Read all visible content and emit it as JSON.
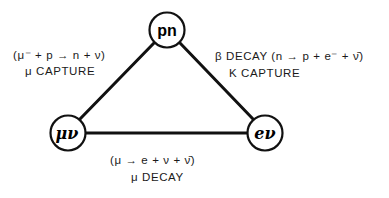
{
  "diagram": {
    "type": "triangle-interaction-diagram",
    "nodes": [
      {
        "id": "pn",
        "label": "pn",
        "cx": 167,
        "cy": 30,
        "r": 18
      },
      {
        "id": "mu-nu",
        "label": "μν",
        "cx": 68,
        "cy": 133,
        "r": 18
      },
      {
        "id": "e-nu",
        "label": "eν",
        "cx": 265,
        "cy": 133,
        "r": 18
      }
    ],
    "edges": [
      {
        "from": "mu-nu",
        "to": "pn",
        "label": "μ CAPTURE",
        "reaction": "(μ⁻ + p → n + ν)"
      },
      {
        "from": "pn",
        "to": "e-nu",
        "label": "β DECAY / K CAPTURE",
        "reaction": "(n → p + e⁻ + ν̄)"
      },
      {
        "from": "mu-nu",
        "to": "e-nu",
        "label": "μ DECAY",
        "reaction": "(μ → e + ν + ν̄)"
      }
    ],
    "line_color": "#111111"
  },
  "labels": {
    "left_reaction": "(μ⁻ + p → n + ν)",
    "left_name": "μ CAPTURE",
    "right_reaction": "β DECAY (n → p + e⁻ + ν̄)",
    "right_name": "K CAPTURE",
    "bottom_reaction": "(μ → e + ν + ν̄)",
    "bottom_name": "μ DECAY",
    "node_pn": "pn",
    "node_mu_nu": "μν",
    "node_e_nu": "eν"
  }
}
